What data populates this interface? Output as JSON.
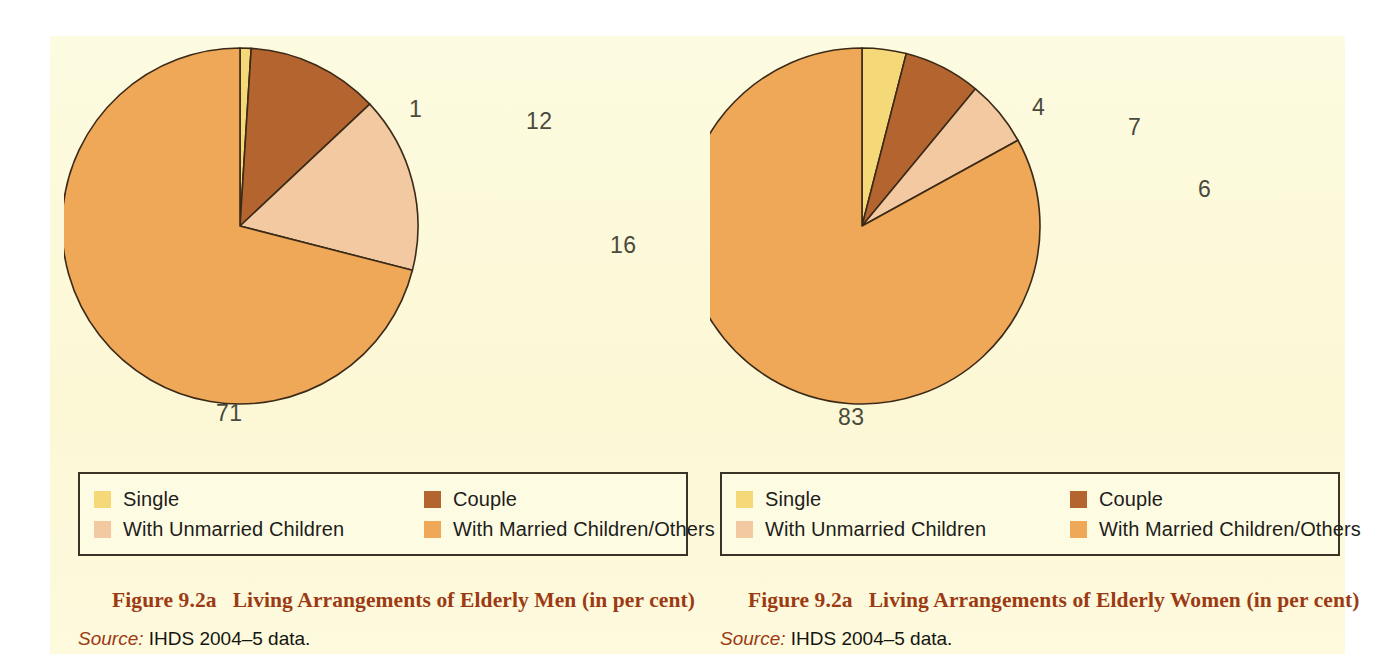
{
  "colors": {
    "page_background": "#fdfada",
    "single": "#f5d878",
    "couple": "#b3642f",
    "with_unmarried_children": "#f2c9a0",
    "with_married_children_others": "#efa758",
    "slice_outline": "#3b2a18",
    "caption": "#9c3a14",
    "legend_border": "#3b3326",
    "label_text": "#4a4a3c"
  },
  "legend": {
    "items": [
      {
        "label": "Single",
        "color_key": "single"
      },
      {
        "label": "Couple",
        "color_key": "couple"
      },
      {
        "label": "With Unmarried Children",
        "color_key": "with_unmarried_children"
      },
      {
        "label": "With Married Children/Others",
        "color_key": "with_married_children_others"
      }
    ]
  },
  "figures": [
    {
      "id": "men",
      "caption_number": "Figure 9.2a",
      "caption_title": "Living Arrangements of Elderly Men (in per cent)",
      "source_label": "Source:",
      "source_text": "IHDS 2004–5 data.",
      "labels": {
        "single": "1",
        "couple": "12",
        "unmarried": "16",
        "married": "71"
      }
    },
    {
      "id": "women",
      "caption_number": "Figure 9.2a",
      "caption_title": "Living Arrangements of Elderly Women (in per cent)",
      "source_label": "Source:",
      "source_text": "IHDS 2004–5 data.",
      "labels": {
        "single": "4",
        "couple": "7",
        "unmarried": "6",
        "married": "83"
      }
    }
  ],
  "chart_data": [
    {
      "type": "pie",
      "title": "Living Arrangements of Elderly Men (in per cent)",
      "units": "per cent",
      "start_angle_deg": 0,
      "direction": "clockwise",
      "legend_position": "bottom",
      "categories": [
        "Single",
        "Couple",
        "With Unmarried Children",
        "With Married Children/Others"
      ],
      "values": [
        1,
        12,
        16,
        71
      ],
      "colors": [
        "#f5d878",
        "#b3642f",
        "#f2c9a0",
        "#efa758"
      ],
      "data_labels": [
        "1",
        "12",
        "16",
        "71"
      ]
    },
    {
      "type": "pie",
      "title": "Living Arrangements of Elderly Women (in per cent)",
      "units": "per cent",
      "start_angle_deg": 0,
      "direction": "clockwise",
      "legend_position": "bottom",
      "categories": [
        "Single",
        "Couple",
        "With Unmarried Children",
        "With Married Children/Others"
      ],
      "values": [
        4,
        7,
        6,
        83
      ],
      "colors": [
        "#f5d878",
        "#b3642f",
        "#f2c9a0",
        "#efa758"
      ],
      "data_labels": [
        "4",
        "7",
        "6",
        "83"
      ]
    }
  ]
}
